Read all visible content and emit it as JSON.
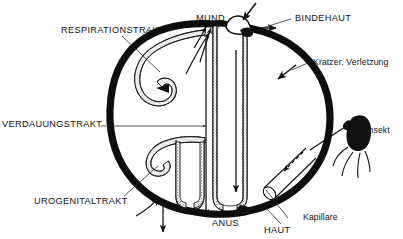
{
  "figure": {
    "language": "de",
    "style": "black-and-white anatomical schematic, stippled tracts",
    "colors": {
      "background": "#ffffff",
      "ink": "#111111",
      "skin_wall": "#0d0d0d",
      "tract_stipple": "#8c8c8c",
      "lumen": "#ffffff",
      "leader_line": "#2b2b2b"
    }
  },
  "labels": {
    "respirationstrakt": "RESPIRATIONSTRAKT",
    "mund": "MUND",
    "bindehaut": "BINDEHAUT",
    "kratzer_verletzung": "Kratzer, Verletzung",
    "insekt": "Insekt",
    "verdauungstrakt": "VERDAUUNGSTRAKT",
    "urogenitaltrakt": "UROGENITALTRAKT",
    "anus": "ANUS",
    "haut": "HAUT",
    "kapillare": "Kapillare"
  },
  "structures": [
    {
      "id": "skin-boundary",
      "name": "HAUT",
      "description": "durchgehende schwarze Koerpergrenze"
    },
    {
      "id": "respiratory-tract",
      "name": "RESPIRATIONSTRAKT",
      "description": "obere Schleife, gepunktete Wandung"
    },
    {
      "id": "digestive-tract",
      "name": "VERDAUUNGSTRAKT",
      "description": "zentraler Kanal von MUND bis ANUS"
    },
    {
      "id": "urogenital-tract",
      "name": "UROGENITALTRAKT",
      "description": "untere Schleife, gepunktete Wandung"
    },
    {
      "id": "conjunctiva",
      "name": "BINDEHAUT",
      "description": "heller Vorsprung am oberen Pol"
    },
    {
      "id": "capillary",
      "name": "Kapillare",
      "description": "angeschnittenes Blutgefaess unter der Haut"
    },
    {
      "id": "insect",
      "name": "Insekt",
      "description": "stechendes Insekt rechts aussen"
    },
    {
      "id": "scratch",
      "name": "Kratzer, Verletzung",
      "description": "Hautdefekt an der rechten Flanke"
    }
  ],
  "entry_routes": [
    {
      "route": "MUND",
      "direction": "ein und aus"
    },
    {
      "route": "RESPIRATIONSTRAKT",
      "direction": "ein"
    },
    {
      "route": "BINDEHAUT",
      "direction": "ein und aus"
    },
    {
      "route": "Kratzer, Verletzung",
      "direction": "ein"
    },
    {
      "route": "Insekt / Kapillare",
      "direction": "ein"
    },
    {
      "route": "UROGENITALTRAKT",
      "direction": "ein und aus"
    },
    {
      "route": "ANUS",
      "direction": "aus"
    }
  ]
}
